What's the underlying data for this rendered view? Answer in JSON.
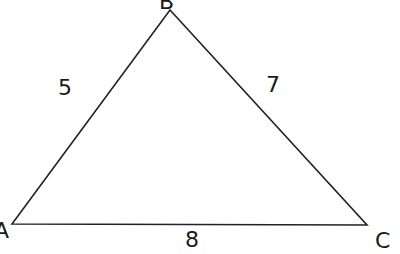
{
  "diagram": {
    "type": "triangle",
    "vertices": [
      {
        "label": "A",
        "x": 12,
        "y": 224
      },
      {
        "label": "B",
        "x": 170,
        "y": 10
      },
      {
        "label": "C",
        "x": 367,
        "y": 225
      }
    ],
    "sides": [
      {
        "between": "AB",
        "length_label": "5"
      },
      {
        "between": "BC",
        "length_label": "7"
      },
      {
        "between": "AC",
        "length_label": "8"
      }
    ],
    "stroke_color": "#222222"
  }
}
